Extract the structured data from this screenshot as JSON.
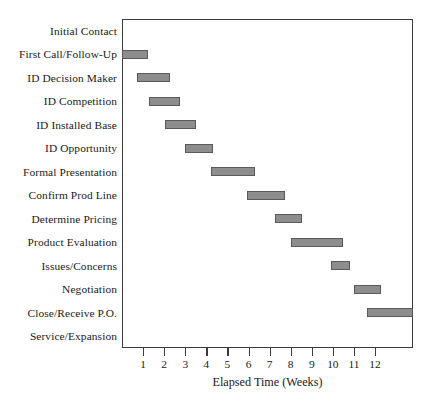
{
  "chart_data": {
    "type": "bar",
    "chart_style": "gantt",
    "title": "",
    "xlabel": "Elapsed Time (Weeks)",
    "ylabel": "",
    "xlim": [
      0,
      13.8
    ],
    "ylim": [
      0,
      14
    ],
    "grid": false,
    "legend": null,
    "x_ticks": [
      1,
      2,
      3,
      4,
      5,
      6,
      7,
      8,
      9,
      10,
      11,
      12
    ],
    "x_tick_labels": [
      "1",
      "2",
      "3",
      "4",
      "5",
      "6",
      "7",
      "8",
      "9",
      "10",
      "11",
      "12"
    ],
    "bar_color": "#8d8d8d",
    "bar_edge_color": "#5a5a5a",
    "axis_color": "#3b3b3b",
    "categories": [
      "Initial Contact",
      "First Call/Follow-Up",
      "ID Decision Maker",
      "ID Competition",
      "ID Installed Base",
      "ID Opportunity",
      "Formal Presentation",
      "Confirm Prod Line",
      "Determine Pricing",
      "Product Evaluation",
      "Issues/Concerns",
      "Negotiation",
      "Close/Receive P.O.",
      "Service/Expansion"
    ],
    "tasks": [
      {
        "label": "Initial Contact",
        "start": 0.0,
        "end": 0.0,
        "duration": 0.0
      },
      {
        "label": "First Call/Follow-Up",
        "start": 0.0,
        "end": 1.25,
        "duration": 1.25
      },
      {
        "label": "ID Decision Maker",
        "start": 0.7,
        "end": 2.3,
        "duration": 1.6
      },
      {
        "label": "ID Competition",
        "start": 1.3,
        "end": 2.75,
        "duration": 1.45
      },
      {
        "label": "ID Installed Base",
        "start": 2.05,
        "end": 3.5,
        "duration": 1.45
      },
      {
        "label": "ID Opportunity",
        "start": 3.0,
        "end": 4.3,
        "duration": 1.3
      },
      {
        "label": "Formal Presentation",
        "start": 4.2,
        "end": 6.3,
        "duration": 2.1
      },
      {
        "label": "Confirm Prod Line",
        "start": 5.95,
        "end": 7.75,
        "duration": 1.8
      },
      {
        "label": "Determine Pricing",
        "start": 7.25,
        "end": 8.55,
        "duration": 1.3
      },
      {
        "label": "Product Evaluation",
        "start": 8.0,
        "end": 10.5,
        "duration": 2.5
      },
      {
        "label": "Issues/Concerns",
        "start": 9.9,
        "end": 10.8,
        "duration": 0.9
      },
      {
        "label": "Negotiation",
        "start": 11.0,
        "end": 12.3,
        "duration": 1.3
      },
      {
        "label": "Close/Receive P.O.",
        "start": 11.6,
        "end": 13.8,
        "duration": 2.2
      },
      {
        "label": "Service/Expansion",
        "start": 0.0,
        "end": 0.0,
        "duration": 0.0
      }
    ]
  }
}
